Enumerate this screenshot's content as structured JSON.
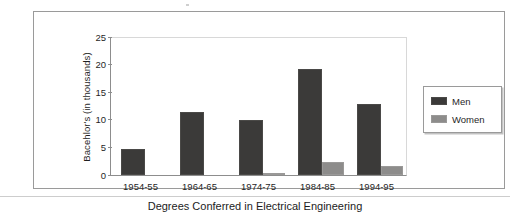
{
  "caption": "Degrees Conferred in Electrical Engineering",
  "colors": {
    "men": "#3b3a39",
    "women": "#8d8c8b",
    "frame": "#9a9a9a",
    "axis": "#8d8d8d",
    "background": "#ffffff"
  },
  "legend": {
    "items": [
      {
        "label": "Men",
        "color": "#3b3a39"
      },
      {
        "label": "Women",
        "color": "#8d8c8b"
      }
    ]
  },
  "axes": {
    "y_title": "Bacehlor's (in thousands)",
    "y_ticks": [
      "25",
      "20",
      "15",
      "10",
      "5",
      "0"
    ],
    "x_ticks": [
      "1954-55",
      "1964-65",
      "1974-75",
      "1984-85",
      "1994-95"
    ]
  },
  "chart_data": {
    "type": "bar",
    "title": "",
    "subtitle": "",
    "categories": [
      "1954-55",
      "1964-65",
      "1974-75",
      "1984-85",
      "1994-95"
    ],
    "series": [
      {
        "name": "Men",
        "values": [
          4.7,
          11.5,
          10.0,
          19.2,
          12.8
        ]
      },
      {
        "name": "Women",
        "values": [
          0.0,
          0.0,
          0.15,
          2.3,
          1.6
        ]
      }
    ],
    "xlabel": "",
    "ylabel": "Bacehlor's (in thousands)",
    "ylim": [
      0,
      25
    ],
    "ytick_step": 5,
    "grid": false,
    "legend_position": "right",
    "annotation": "Degrees Conferred in Electrical Engineering"
  }
}
